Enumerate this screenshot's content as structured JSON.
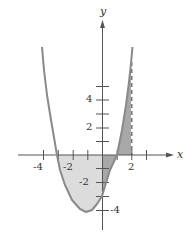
{
  "figure": {
    "function": "y = x^2 + 2x - 3",
    "x_axis_label": "x",
    "y_axis_label": "y",
    "x_tick_labels": [
      "-4",
      "-2",
      "2"
    ],
    "y_tick_labels_positive": [
      "2",
      "4"
    ],
    "y_tick_labels_negative": [
      "-2",
      "-4"
    ],
    "dashed_line": "x = 2",
    "shaded_regions": [
      {
        "name": "light-region",
        "from_x": -3,
        "to_x": 0,
        "side": "below x-axis"
      },
      {
        "name": "dark-region-below",
        "from_x": 0,
        "to_x": 1,
        "side": "below x-axis"
      },
      {
        "name": "dark-region-above",
        "from_x": 1,
        "to_x": 2,
        "side": "above x-axis"
      }
    ]
  },
  "colors": {
    "curve": "#8a8a8a",
    "axis": "#555555",
    "light_shade": "#dcdcdc",
    "dark_shade": "#a8a8a8"
  }
}
